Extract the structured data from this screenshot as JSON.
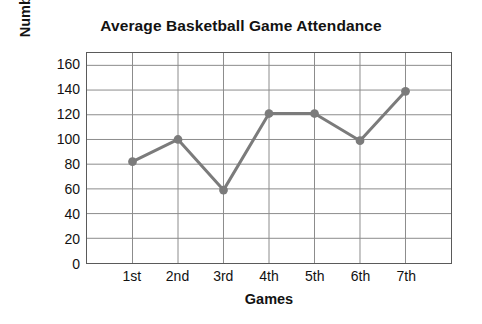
{
  "chart_data": {
    "type": "line",
    "title": "Average Basketball Game Attendance",
    "xlabel": "Games",
    "ylabel": "Number of Students",
    "categories": [
      "1st",
      "2nd",
      "3rd",
      "4th",
      "5th",
      "6th",
      "7th"
    ],
    "values": [
      82,
      100,
      59,
      121,
      121,
      99,
      139
    ],
    "series": [
      {
        "name": "Average Basketball Game Attendance",
        "values": [
          82,
          100,
          59,
          121,
          121,
          99,
          139
        ]
      }
    ],
    "ylim": [
      0,
      170
    ],
    "yticks": [
      0,
      20,
      40,
      60,
      80,
      100,
      120,
      140,
      160
    ],
    "ytick_labels": [
      "0",
      "20",
      "40",
      "60",
      "80",
      "100",
      "120",
      "140",
      "160"
    ],
    "grid": true,
    "legend": false,
    "legend_position": "none",
    "line_color": "#7b7b7b",
    "marker_color": "#7b7b7b",
    "grid_color": "#8c8c8c",
    "axis_color": "#5a5a5a",
    "text_color": "#121212"
  }
}
